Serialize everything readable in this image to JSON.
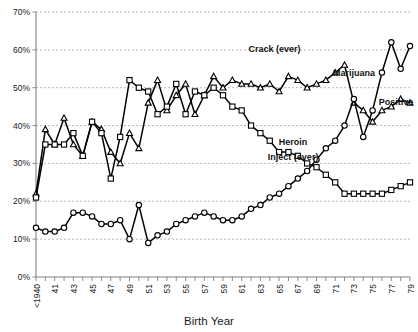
{
  "chart_data": {
    "type": "line",
    "title": "",
    "xlabel": "Birth Year",
    "ylabel": "",
    "ylim": [
      0,
      70
    ],
    "ytick_labels": [
      "0%",
      "10%",
      "20%",
      "30%",
      "40%",
      "50%",
      "60%",
      "70%"
    ],
    "ytick_values": [
      0,
      10,
      20,
      30,
      40,
      50,
      60,
      70
    ],
    "grid": true,
    "legend_position": "inline-annotations",
    "x": [
      "<1940",
      "40",
      "41",
      "42",
      "43",
      "44",
      "45",
      "46",
      "47",
      "48",
      "49",
      "50",
      "51",
      "52",
      "53",
      "54",
      "55",
      "56",
      "57",
      "58",
      "59",
      "60",
      "61",
      "62",
      "63",
      "64",
      "65",
      "66",
      "67",
      "68",
      "69",
      "70",
      "71",
      "72",
      "73",
      "74",
      "75",
      "76",
      "77",
      "78",
      "79"
    ],
    "xtick_labels": [
      "<1940",
      "41",
      "43",
      "45",
      "47",
      "49",
      "51",
      "53",
      "55",
      "57",
      "59",
      "61",
      "63",
      "65",
      "67",
      "69",
      "71",
      "73",
      "75",
      "77",
      "79"
    ],
    "series": [
      {
        "name": "Crack (ever)",
        "marker": "triangle",
        "label_x": 55,
        "label_y": 57,
        "values": [
          22,
          39,
          35,
          42,
          35,
          32,
          41,
          39,
          33,
          30,
          38,
          34,
          46,
          52,
          44,
          48,
          51,
          43,
          48,
          53,
          50,
          52,
          51,
          51,
          50,
          51,
          49,
          53,
          52,
          50,
          51,
          52,
          54,
          56,
          46,
          44,
          41,
          44,
          45,
          47,
          46
        ]
      },
      {
        "name": "Heroin Inject (ever)",
        "marker": "square",
        "label_x": 58,
        "label_y": 33,
        "values": [
          21,
          35,
          35,
          35,
          38,
          32,
          41,
          38,
          26,
          37,
          52,
          50,
          49,
          43,
          45,
          51,
          43,
          49,
          48,
          50,
          48,
          45,
          44,
          40,
          38,
          36,
          33,
          33,
          32,
          30,
          29,
          27,
          25,
          22,
          22,
          22,
          22,
          22,
          23,
          24,
          25
        ]
      },
      {
        "name": "Marijuana Positive",
        "marker": "circle",
        "label_x": 70,
        "label_y": 46,
        "values": [
          13,
          12,
          12,
          13,
          17,
          17,
          16,
          14,
          14,
          15,
          10,
          19,
          9,
          11,
          12,
          14,
          15,
          16,
          17,
          16,
          15,
          15,
          16,
          18,
          19,
          21,
          22,
          24,
          26,
          28,
          31,
          34,
          36,
          40,
          47,
          37,
          44,
          54,
          62,
          55,
          61
        ]
      }
    ],
    "annotations": [
      {
        "text": "Crack (ever)",
        "name": "crack-ever-label"
      },
      {
        "text": "Heroin",
        "name": "heroin-label-line1"
      },
      {
        "text": "Inject (ever)",
        "name": "heroin-label-line2"
      },
      {
        "text": "Marijuana",
        "name": "marijuana-label"
      },
      {
        "text": "Positive",
        "name": "positive-label"
      }
    ],
    "colors": {
      "line": "#000000",
      "marker_fill": "#ffffff",
      "grid": "#9a9a9a",
      "axis": "#808080",
      "text": "#1a1a1a"
    }
  }
}
